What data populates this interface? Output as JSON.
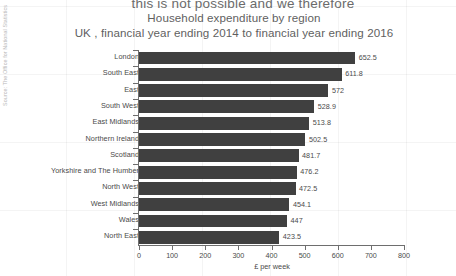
{
  "document_excerpt": "this is not possible and we therefore",
  "source_note": "Source: The Office for National Statistics",
  "chart_data": {
    "type": "bar",
    "orientation": "horizontal",
    "title": "Household expenditure by region",
    "subtitle": "UK , financial year ending 2014 to financial year ending 2016",
    "xlabel": "£ per week",
    "ylabel": "",
    "xlim": [
      0,
      800
    ],
    "xticks": [
      0,
      100,
      200,
      300,
      400,
      500,
      600,
      700,
      800
    ],
    "xtick_labels": [
      "0",
      "100",
      "200",
      "300",
      "400",
      "500",
      "600",
      "700",
      "800"
    ],
    "grid": false,
    "legend": "none",
    "bar_color": "#404040",
    "categories": [
      "London",
      "South East",
      "East",
      "South West",
      "East Midlands",
      "Northern Ireland",
      "Scotland",
      "Yorkshire and The Humber",
      "North West",
      "West Midlands",
      "Wales",
      "North East"
    ],
    "values": [
      652.5,
      611.8,
      572,
      528.9,
      513.8,
      502.5,
      481.7,
      476.2,
      472.5,
      454.1,
      447,
      423.5
    ],
    "value_labels": [
      "652.5",
      "611.8",
      "572",
      "528.9",
      "513.8",
      "502.5",
      "481.7",
      "476.2",
      "472.5",
      "454.1",
      "447",
      "423.5"
    ]
  }
}
